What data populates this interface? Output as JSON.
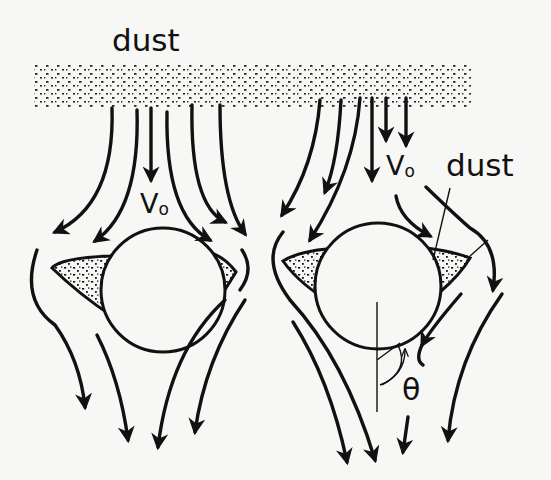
{
  "diagram": {
    "type": "flow-schematic",
    "labels": {
      "dust_top": "dust",
      "v0_left": "V",
      "v0_left_sub": "o",
      "v0_right": "V",
      "v0_right_sub": "o",
      "dust_right": "dust",
      "theta": "θ"
    },
    "panels": [
      {
        "name": "left-cylinder",
        "center": [
          165,
          290
        ],
        "radius": 62
      },
      {
        "name": "right-cylinder",
        "center": [
          375,
          285
        ],
        "radius": 64
      }
    ],
    "colors": {
      "ink": "#111111",
      "paper": "#f7f7f5"
    }
  }
}
